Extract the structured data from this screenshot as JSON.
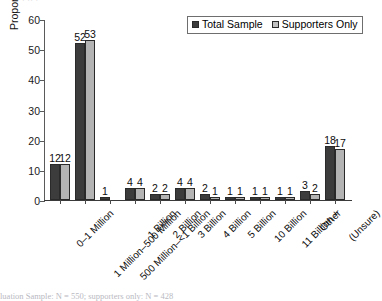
{
  "figure": {
    "top_clipped_text": "·    ··        ·",
    "footnote": "luation Sample: N = 550; supporters only: N = 428"
  },
  "legend": {
    "position": "top-right",
    "entries": [
      {
        "label": "Total Sample",
        "color": "#3c3c3c"
      },
      {
        "label": "Supporters Only",
        "color": "#c2c2c2"
      }
    ]
  },
  "chart_data": {
    "type": "bar",
    "title": "",
    "xlabel": "",
    "ylabel": "Proportion of Respondents",
    "ylim": [
      0,
      60
    ],
    "yticks": [
      0,
      10,
      20,
      30,
      40,
      50,
      60
    ],
    "grid": false,
    "categories": [
      "0–1 Million",
      "1 Million–500 Million",
      "500 Million–<1 Billion",
      "1 Billion",
      "2 Billion",
      "3 Billion",
      "4 Billion",
      "5 Billion",
      "10 Billion",
      "11 Billion +",
      "Other",
      "(Unsure)"
    ],
    "series": [
      {
        "name": "Total Sample",
        "color": "#3c3c3c",
        "values": [
          12,
          52,
          1,
          4,
          2,
          4,
          2,
          1,
          1,
          1,
          3,
          18
        ]
      },
      {
        "name": "Supporters Only",
        "color": "#b4b4b4",
        "values": [
          12,
          53,
          null,
          4,
          2,
          4,
          1,
          1,
          1,
          1,
          2,
          17
        ]
      }
    ],
    "data_labels": [
      [
        "12",
        "12"
      ],
      [
        "52",
        "53"
      ],
      [
        "1",
        ""
      ],
      [
        "4",
        "4"
      ],
      [
        "2",
        "2"
      ],
      [
        "4",
        "4"
      ],
      [
        "2",
        "1"
      ],
      [
        "1",
        "1"
      ],
      [
        "1",
        "1"
      ],
      [
        "1",
        "1"
      ],
      [
        "3",
        "2"
      ],
      [
        "18",
        "17"
      ]
    ]
  }
}
